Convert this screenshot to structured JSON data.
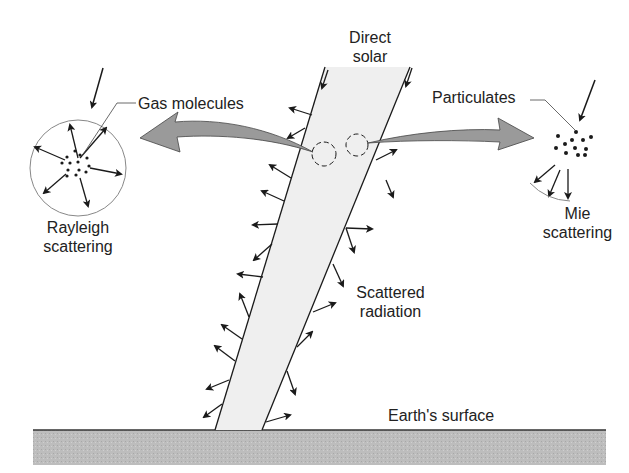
{
  "labels": {
    "direct_solar_line1": "Direct",
    "direct_solar_line2": "solar",
    "gas_molecules": "Gas molecules",
    "particulates": "Particulates",
    "rayleigh_line1": "Rayleigh",
    "rayleigh_line2": "scattering",
    "mie_line1": "Mie",
    "mie_line2": "scattering",
    "scattered_line1": "Scattered",
    "scattered_line2": "radiation",
    "earth_surface": "Earth's surface"
  },
  "colors": {
    "beam_fill": "#efefef",
    "ground_fill": "#bdbdbd",
    "arrow_fill": "#9a9a9a",
    "ink": "#1a1a1a"
  }
}
